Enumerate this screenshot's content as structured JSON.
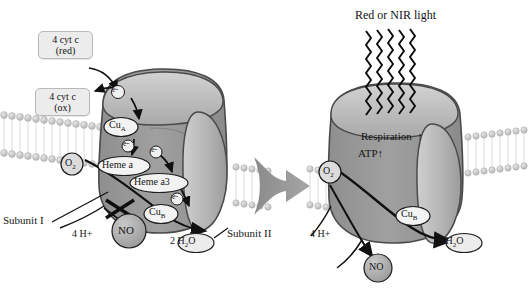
{
  "figure": {
    "type": "biochemical-pathway-diagram",
    "background_color": "#ffffff",
    "panel_count": 2
  },
  "palette": {
    "enzyme_body": "#9a9a9a",
    "enzyme_body_light": "#b9b9b9",
    "enzyme_cap": "#c3c3c3",
    "enzyme_outline": "#4a4a4a",
    "membrane_head": "#c9c9c9",
    "membrane_tail": "#dedede",
    "callout_fill": "#ececec",
    "cofactor_fill": "#f2f2f2",
    "no_fill": "#a8a8a8",
    "arrow_black": "#101010",
    "transition_arrow": "#8e8e8e",
    "text": "#151515"
  },
  "left_panel": {
    "name": "nitric-oxide-inhibition",
    "callouts": [
      {
        "id": "cyt-c-red",
        "line1": "4 cyt c",
        "line2": "(red)"
      },
      {
        "id": "cyt-c-ox",
        "line1": "4 cyt c",
        "line2": "(ox)"
      }
    ],
    "cofactors": [
      {
        "id": "cu-a",
        "label": "Cu",
        "sub": "A",
        "shape": "ellipse"
      },
      {
        "id": "heme-a",
        "label": "Heme a",
        "sub": "",
        "shape": "ellipse"
      },
      {
        "id": "heme-a3",
        "label": "Heme a3",
        "sub": "",
        "shape": "ellipse"
      },
      {
        "id": "cu-b",
        "label": "Cu",
        "sub": "B",
        "shape": "ellipse"
      }
    ],
    "electrons": [
      {
        "id": "e-entry",
        "label": "e-"
      },
      {
        "id": "e-cua",
        "label": "e-"
      },
      {
        "id": "e-hemea",
        "label": "e-"
      },
      {
        "id": "e-hemea3",
        "label": "e-"
      }
    ],
    "substrates": [
      {
        "id": "o2",
        "label": "O",
        "sub": "2",
        "shape": "circle"
      },
      {
        "id": "no",
        "label": "NO",
        "sub": "",
        "shape": "circle"
      },
      {
        "id": "h2o",
        "prefix": "2",
        "label": "H",
        "sub": "2",
        "suffix": "O",
        "shape": "ellipse"
      }
    ],
    "protons": {
      "id": "protons",
      "prefix": "4",
      "label": "H+"
    },
    "inhibition_marker": {
      "id": "inhibition-cross",
      "symbol": "cross",
      "meaning": "NO blocks O2 binding"
    },
    "subunit_labels": [
      {
        "id": "subunit-1",
        "text": "Subunit I"
      },
      {
        "id": "subunit-2",
        "text": "Subunit II"
      }
    ]
  },
  "transition": {
    "id": "transition-arrow",
    "direction": "left-to-right"
  },
  "right_panel": {
    "name": "red-nir-photobiomodulation",
    "title": "Red or NIR light",
    "light_beam": {
      "id": "light-beam",
      "style": "zigzag-waves",
      "count": 5
    },
    "effects": [
      {
        "id": "respiration-effect",
        "text": "Respiration",
        "arrow": "↑"
      },
      {
        "id": "atp-effect",
        "text": "ATP",
        "arrow": "↑"
      }
    ],
    "cofactors": [
      {
        "id": "cu-b-right",
        "label": "Cu",
        "sub": "B",
        "shape": "ellipse"
      }
    ],
    "substrates": [
      {
        "id": "o2-right",
        "label": "O",
        "sub": "2",
        "shape": "circle"
      },
      {
        "id": "no-right",
        "label": "NO",
        "sub": "",
        "shape": "circle"
      },
      {
        "id": "h2o-right",
        "prefix": "2",
        "label": "H",
        "sub": "2",
        "suffix": "O",
        "shape": "ellipse"
      }
    ],
    "protons": {
      "id": "protons-right",
      "prefix": "4",
      "label": "H+"
    }
  }
}
